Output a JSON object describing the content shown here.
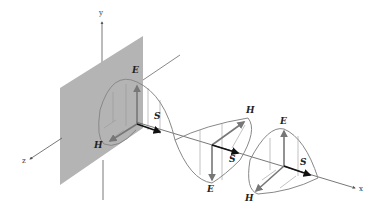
{
  "diagram": {
    "axes": {
      "x": "x",
      "y": "y",
      "z": "z"
    },
    "field_labels": {
      "E1": "E",
      "E2": "E",
      "E3": "E",
      "H1": "H",
      "H2": "H",
      "H3": "H",
      "S1": "S",
      "S2": "S",
      "S3": "S"
    },
    "colors": {
      "plane": "#b4b4b4",
      "curve": "#888888",
      "field_arrow": "#777777",
      "poynting_arrow": "#111111",
      "axis": "#555555"
    }
  }
}
